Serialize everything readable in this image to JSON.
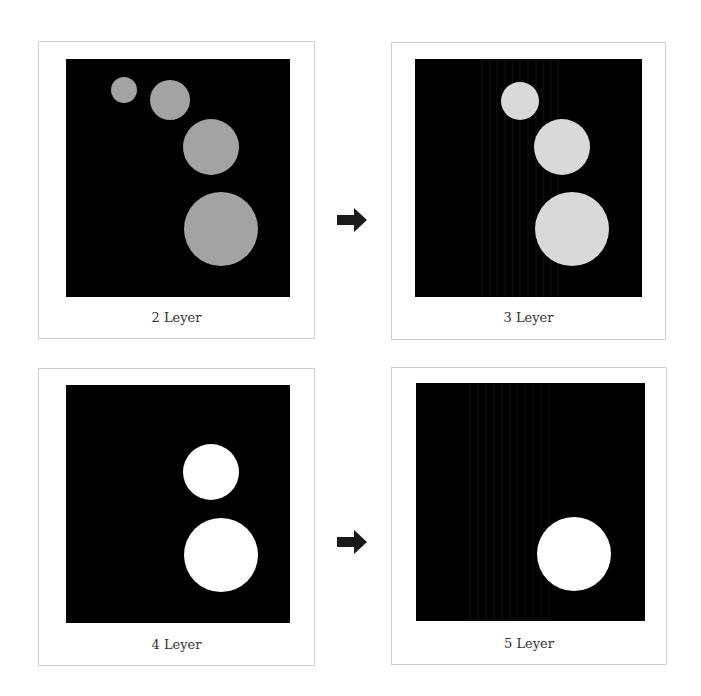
{
  "panels": [
    {
      "caption": "2 Leyer",
      "circle_color": "#a3a3a3",
      "circles": [
        {
          "cx": 124,
          "cy": 90,
          "r": 13
        },
        {
          "cx": 170,
          "cy": 100,
          "r": 20
        },
        {
          "cx": 211,
          "cy": 147,
          "r": 28
        },
        {
          "cx": 221,
          "cy": 229,
          "r": 37
        }
      ],
      "streaks": false
    },
    {
      "caption": "3 Leyer",
      "circle_color": "#d9d9d9",
      "circles": [
        {
          "cx": 520,
          "cy": 101,
          "r": 19
        },
        {
          "cx": 562,
          "cy": 147,
          "r": 28
        },
        {
          "cx": 572,
          "cy": 229,
          "r": 37
        }
      ],
      "streaks": true
    },
    {
      "caption": "4 Leyer",
      "circle_color": "#ffffff",
      "circles": [
        {
          "cx": 211,
          "cy": 472,
          "r": 28
        },
        {
          "cx": 221,
          "cy": 555,
          "r": 37
        }
      ],
      "streaks": false
    },
    {
      "caption": "5 Leyer",
      "circle_color": "#ffffff",
      "circles": [
        {
          "cx": 574,
          "cy": 554,
          "r": 37
        }
      ],
      "streaks": true
    }
  ],
  "arrows": [
    {
      "name": "arrow-right-icon",
      "from": "2 Leyer",
      "to": "3 Leyer"
    },
    {
      "name": "arrow-right-icon",
      "from": "4 Leyer",
      "to": "5 Leyer"
    }
  ],
  "colors": {
    "background": "#ffffff",
    "panel_border": "#cfcfcf",
    "image_background": "#000000",
    "arrow": "#1a1a1a",
    "caption_text": "#333333"
  }
}
